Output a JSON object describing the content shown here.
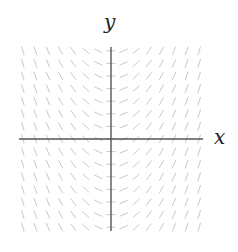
{
  "diagram": {
    "type": "slope-field",
    "equation": "dy/dx = x",
    "x_axis_label": "x",
    "y_axis_label": "y",
    "grid": {
      "x_min": -7,
      "x_max": 7,
      "y_min": -7,
      "y_max": 7,
      "step": 1
    },
    "slope_scale": 0.45,
    "mark_length_px": 9,
    "colors": {
      "axis": "#555555",
      "marks": "#c8c8c8",
      "label": "#222222"
    },
    "layout": {
      "origin_px": [
        111,
        139
      ],
      "spacing_px": 12.6,
      "x_axis_px": [
        19,
        203
      ],
      "y_axis_px": [
        47,
        231
      ]
    }
  }
}
